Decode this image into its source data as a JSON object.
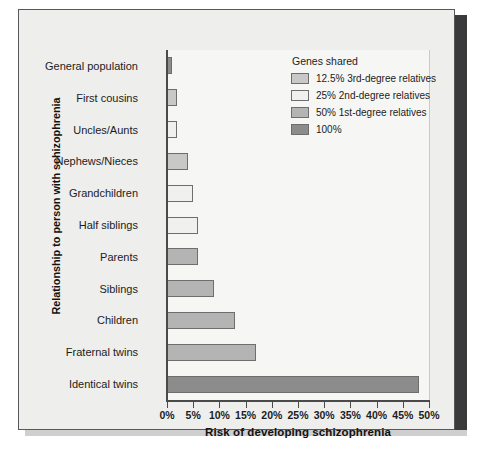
{
  "chart_data": {
    "type": "bar",
    "orientation": "horizontal",
    "title": "",
    "xlabel": "Risk of developing schizophrenia",
    "ylabel": "Relationship to person with schizophrenia",
    "xlim": [
      0,
      50
    ],
    "xticks": [
      "0%",
      "5%",
      "10%",
      "15%",
      "20%",
      "25%",
      "30%",
      "35%",
      "40%",
      "45%",
      "50%"
    ],
    "xtick_values": [
      0,
      5,
      10,
      15,
      20,
      25,
      30,
      35,
      40,
      45,
      50
    ],
    "grid": true,
    "categories": [
      "General population",
      "First cousins",
      "Uncles/Aunts",
      "Nephews/Nieces",
      "Grandchildren",
      "Half siblings",
      "Parents",
      "Siblings",
      "Children",
      "Fraternal twins",
      "Identical twins"
    ],
    "values": [
      1,
      2,
      2,
      4,
      5,
      6,
      6,
      9,
      13,
      17,
      48
    ],
    "group_of_bar": [
      "100%",
      "12.5% 3rd-degree relatives",
      "25% 2nd-degree relatives",
      "12.5% 3rd-degree relatives",
      "25% 2nd-degree relatives",
      "25% 2nd-degree relatives",
      "50% 1st-degree relatives",
      "50% 1st-degree relatives",
      "50% 1st-degree relatives",
      "50% 1st-degree relatives",
      "100%"
    ],
    "bar_colors": [
      "#8c8c8c",
      "#c8c8c8",
      "#f0f0ee",
      "#c8c8c8",
      "#f0f0ee",
      "#f0f0ee",
      "#b4b4b4",
      "#b4b4b4",
      "#b4b4b4",
      "#b4b4b4",
      "#8c8c8c"
    ],
    "legend": {
      "title": "Genes shared",
      "position": "upper right",
      "entries": [
        {
          "label": "12.5% 3rd-degree relatives",
          "color": "#c8c8c8"
        },
        {
          "label": "25% 2nd-degree relatives",
          "color": "#f0f0ee"
        },
        {
          "label": "50% 1st-degree relatives",
          "color": "#b4b4b4"
        },
        {
          "label": "100%",
          "color": "#8c8c8c"
        }
      ]
    },
    "colors": {
      "plot_background": "#f6f6f4",
      "panel_background": "#eeeeec",
      "axis": "#4a4a4a",
      "grid": "#c9c9c5",
      "bar_edge": "#6e6e6e",
      "text": "#1c1c1c",
      "shadow": "#3a3a3a"
    }
  }
}
